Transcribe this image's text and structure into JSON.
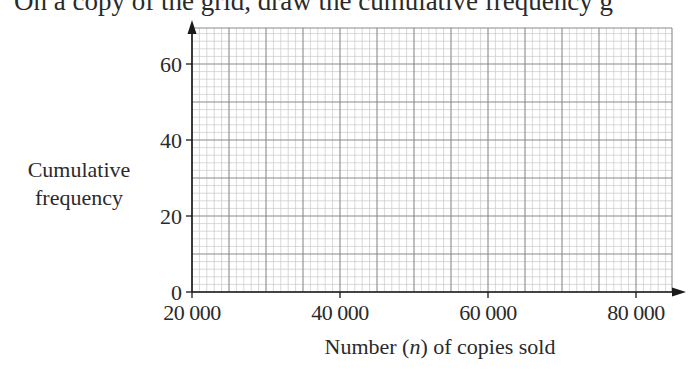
{
  "instruction_text": "On a copy of the grid, draw the cumulative frequency g",
  "chart_data": {
    "type": "line",
    "title": "",
    "xlabel_parts": {
      "before": "Number (",
      "var": "n",
      "after": ") of copies sold"
    },
    "xlabel": "Number (n) of copies sold",
    "ylabel_lines": [
      "Cumulative",
      "frequency"
    ],
    "ylabel": "Cumulative frequency",
    "x_ticks": [
      "20000",
      "40000",
      "60000",
      "80000"
    ],
    "x_tick_labels": [
      "20 000",
      "40 000",
      "60 000",
      "80 000"
    ],
    "y_ticks": [
      "0",
      "20",
      "40",
      "60"
    ],
    "xlim": [
      20000,
      84865
    ],
    "ylim": [
      0,
      69.5
    ],
    "x_major_step": 5000,
    "x_minor_step": 1000,
    "y_major_step": 10,
    "y_minor_step": 2,
    "grid": true,
    "series": [],
    "legend": null
  },
  "colors": {
    "axis": "#1a1a1a",
    "major_grid": "#8a8a8a",
    "minor_grid": "#c8c8c8",
    "text": "#2a2a2a"
  }
}
